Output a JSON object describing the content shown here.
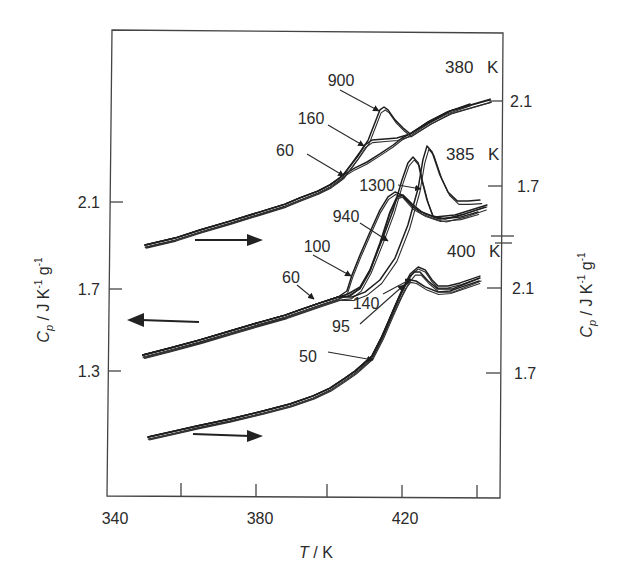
{
  "chart_data": {
    "type": "line",
    "title": "",
    "xlabel": "T / K",
    "xlabel_parts": {
      "symbol": "T",
      "unit": " / K"
    },
    "ylabel": "Cp / J K-1 g-1",
    "ylabel_parts": {
      "symbol": "C",
      "sub": "p",
      "unit1": " / J K",
      "exp1": "-1",
      "unit2": " g",
      "exp2": "-1"
    },
    "xlim": [
      340,
      447
    ],
    "x_ticks": [
      360,
      380,
      400,
      420,
      440
    ],
    "x_tick_labels": [
      "340",
      "380",
      "420"
    ],
    "grid": false,
    "legend": "none (curves labeled inline with arrows)",
    "axes": {
      "left": {
        "tick_labels": [
          "2.1",
          "1.7",
          "1.3"
        ],
        "ylim": [
          0.7,
          2.9
        ],
        "applies_to": "385 K"
      },
      "right_upper": {
        "tick_labels": [
          "2.1",
          "1.7"
        ],
        "applies_to": "380 K"
      },
      "right_lower": {
        "tick_labels": [
          "2.1",
          "1.7"
        ],
        "applies_to": "400 K"
      },
      "right_axis_break": true
    },
    "direction_arrows": [
      {
        "group": "380 K",
        "direction": "right"
      },
      {
        "group": "385 K",
        "direction": "left"
      },
      {
        "group": "400 K",
        "direction": "right"
      }
    ],
    "groups": [
      {
        "label": "380 K",
        "axis": "right_upper",
        "baseline": [
          [
            350.1,
            1.422
          ],
          [
            358.2,
            1.455
          ],
          [
            365.0,
            1.493
          ],
          [
            373.2,
            1.535
          ],
          [
            381.4,
            1.578
          ],
          [
            388.2,
            1.615
          ],
          [
            392.2,
            1.644
          ],
          [
            397.1,
            1.676
          ],
          [
            400.4,
            1.705
          ],
          [
            402.6,
            1.733
          ],
          [
            404.0,
            1.752
          ]
        ],
        "series": [
          {
            "name": "60",
            "points": [
              [
                407.2,
                1.785
              ],
              [
                410.5,
                1.813
              ],
              [
                414.0,
                1.851
              ],
              [
                417.6,
                1.893
              ],
              [
                420.0,
                1.926
              ],
              [
                422.2,
                1.945
              ],
              [
                427.1,
                2.001
              ],
              [
                432.2,
                2.048
              ],
              [
                438.5,
                2.086
              ]
            ]
          },
          {
            "name": "160",
            "points": [
              [
                406.4,
                1.804
              ],
              [
                408.0,
                1.841
              ],
              [
                409.9,
                1.893
              ],
              [
                411.8,
                1.916
              ],
              [
                415.4,
                1.921
              ],
              [
                418.6,
                1.926
              ],
              [
                422.2,
                1.945
              ],
              [
                427.6,
                2.001
              ],
              [
                433.1,
                2.053
              ],
              [
                444.0,
                2.105
              ]
            ]
          },
          {
            "name": "900",
            "points": [
              [
                406.4,
                1.808
              ],
              [
                408.6,
                1.86
              ],
              [
                410.8,
                1.916
              ],
              [
                412.7,
                2.001
              ],
              [
                414.0,
                2.058
              ],
              [
                415.1,
                2.072
              ],
              [
                416.2,
                2.058
              ],
              [
                418.1,
                2.011
              ],
              [
                420.3,
                1.973
              ],
              [
                422.2,
                1.945
              ],
              [
                427.6,
                2.006
              ],
              [
                433.1,
                2.053
              ],
              [
                444.0,
                2.109
              ]
            ]
          }
        ]
      },
      {
        "label": "385 K",
        "axis": "left",
        "baseline": [
          [
            349.5,
            1.38
          ],
          [
            356.9,
            1.413
          ],
          [
            365.0,
            1.451
          ],
          [
            373.2,
            1.493
          ],
          [
            381.4,
            1.535
          ],
          [
            388.2,
            1.568
          ],
          [
            392.2,
            1.592
          ],
          [
            397.7,
            1.625
          ],
          [
            402.6,
            1.653
          ]
        ],
        "series": [
          {
            "name": "60",
            "points": [
              [
                405.3,
                1.667
              ],
              [
                408.6,
                1.7
              ],
              [
                411.3,
                1.78
              ],
              [
                414.0,
                1.907
              ],
              [
                416.7,
                2.053
              ],
              [
                418.6,
                2.124
              ],
              [
                420.3,
                2.133
              ],
              [
                422.7,
                2.091
              ],
              [
                425.4,
                2.053
              ],
              [
                429.0,
                2.029
              ],
              [
                434.4,
                2.039
              ],
              [
                443.1,
                2.086
              ]
            ]
          },
          {
            "name": "100",
            "points": [
              [
                405.0,
                1.681
              ],
              [
                406.4,
                1.756
              ],
              [
                408.6,
                1.851
              ],
              [
                411.3,
                1.959
              ],
              [
                414.0,
                2.062
              ],
              [
                416.2,
                2.124
              ],
              [
                418.1,
                2.147
              ],
              [
                420.0,
                2.133
              ],
              [
                423.0,
                2.076
              ],
              [
                426.3,
                2.044
              ],
              [
                430.3,
                2.02
              ],
              [
                435.8,
                2.029
              ],
              [
                440.7,
                2.053
              ]
            ]
          },
          {
            "name": "940",
            "points": [
              [
                405.9,
                1.658
              ],
              [
                408.6,
                1.695
              ],
              [
                411.3,
                1.78
              ],
              [
                414.8,
                1.931
              ],
              [
                417.6,
                2.062
              ],
              [
                420.0,
                2.204
              ],
              [
                421.6,
                2.284
              ],
              [
                423.0,
                2.312
              ],
              [
                424.4,
                2.284
              ],
              [
                425.4,
                2.204
              ],
              [
                426.8,
                2.109
              ],
              [
                428.4,
                2.034
              ],
              [
                431.7,
                2.02
              ],
              [
                437.1,
                2.044
              ],
              [
                442.6,
                2.076
              ]
            ]
          },
          {
            "name": "1300",
            "points": [
              [
                406.4,
                1.653
              ],
              [
                409.9,
                1.676
              ],
              [
                414.0,
                1.733
              ],
              [
                418.1,
                1.836
              ],
              [
                421.6,
                1.992
              ],
              [
                424.4,
                2.166
              ],
              [
                425.7,
                2.298
              ],
              [
                426.8,
                2.364
              ],
              [
                428.2,
                2.336
              ],
              [
                430.3,
                2.227
              ],
              [
                432.5,
                2.147
              ],
              [
                435.0,
                2.105
              ],
              [
                438.0,
                2.105
              ],
              [
                441.2,
                2.109
              ]
            ]
          }
        ]
      },
      {
        "label": "400 K",
        "axis": "right_lower",
        "baseline": [
          [
            350.9,
            1.399
          ],
          [
            358.2,
            1.427
          ],
          [
            364.2,
            1.451
          ],
          [
            373.2,
            1.484
          ],
          [
            382.2,
            1.521
          ],
          [
            389.5,
            1.554
          ],
          [
            395.8,
            1.592
          ],
          [
            400.4,
            1.629
          ],
          [
            404.5,
            1.676
          ],
          [
            407.2,
            1.709
          ],
          [
            409.4,
            1.742
          ],
          [
            411.8,
            1.78
          ]
        ],
        "series": [
          {
            "name": "50",
            "points": [
              [
                414.8,
                1.879
              ],
              [
                417.6,
                1.996
              ],
              [
                420.0,
                2.091
              ],
              [
                422.2,
                2.166
              ],
              [
                424.4,
                2.199
              ],
              [
                426.3,
                2.185
              ],
              [
                428.2,
                2.138
              ],
              [
                429.8,
                2.109
              ],
              [
                432.5,
                2.109
              ],
              [
                435.8,
                2.124
              ],
              [
                441.2,
                2.156
              ]
            ]
          },
          {
            "name": "95",
            "points": [
              [
                414.3,
                1.865
              ],
              [
                416.7,
                1.959
              ],
              [
                418.9,
                2.044
              ],
              [
                420.8,
                2.109
              ],
              [
                422.2,
                2.138
              ],
              [
                423.8,
                2.133
              ],
              [
                426.3,
                2.105
              ],
              [
                429.8,
                2.081
              ],
              [
                433.1,
                2.086
              ],
              [
                436.3,
                2.105
              ],
              [
                441.0,
                2.133
              ]
            ]
          },
          {
            "name": "140",
            "points": [
              [
                414.6,
                1.874
              ],
              [
                417.3,
                1.982
              ],
              [
                419.5,
                2.067
              ],
              [
                421.6,
                2.138
              ],
              [
                423.3,
                2.175
              ],
              [
                424.9,
                2.175
              ],
              [
                427.1,
                2.133
              ],
              [
                429.8,
                2.095
              ],
              [
                433.6,
                2.095
              ],
              [
                437.1,
                2.119
              ],
              [
                441.2,
                2.147
              ]
            ]
          }
        ]
      }
    ],
    "group_labels": [
      "380 K",
      "385 K",
      "400 K"
    ],
    "annotations": [
      {
        "text": "900",
        "group": "380 K"
      },
      {
        "text": "160",
        "group": "380 K"
      },
      {
        "text": "60",
        "group": "380 K"
      },
      {
        "text": "1300",
        "group": "385 K"
      },
      {
        "text": "940",
        "group": "385 K"
      },
      {
        "text": "100",
        "group": "385 K"
      },
      {
        "text": "60",
        "group": "385 K"
      },
      {
        "text": "140",
        "group": "400 K"
      },
      {
        "text": "95",
        "group": "400 K"
      },
      {
        "text": "50",
        "group": "400 K"
      }
    ]
  }
}
